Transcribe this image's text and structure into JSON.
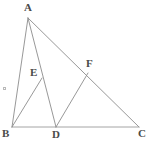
{
  "figure": {
    "width": 149,
    "height": 142,
    "background_color": "#ffffff",
    "stroke_color": "#8c8c8c",
    "base_stroke_color": "#9a9a9a",
    "label_color": "#4a4a4a",
    "stroke_width": 0.9
  },
  "points": {
    "A": {
      "label": "A",
      "x": 28,
      "y": 18,
      "label_x": 24,
      "label_y": 2
    },
    "B": {
      "label": "B",
      "x": 12,
      "y": 127,
      "label_x": 2,
      "label_y": 128
    },
    "C": {
      "label": "C",
      "x": 139,
      "y": 127,
      "label_x": 138,
      "label_y": 128
    },
    "D": {
      "label": "D",
      "x": 56,
      "y": 127,
      "label_x": 52,
      "label_y": 129
    },
    "E": {
      "label": "E",
      "x": 42,
      "y": 78,
      "label_x": 30,
      "label_y": 67
    },
    "F": {
      "label": "F",
      "x": 88,
      "y": 73,
      "label_x": 86,
      "label_y": 58
    }
  },
  "segments": [
    {
      "name": "segment-AB",
      "from": "A",
      "to": "B"
    },
    {
      "name": "segment-AC",
      "from": "A",
      "to": "C"
    },
    {
      "name": "segment-BC",
      "from": "B",
      "to": "C"
    },
    {
      "name": "segment-AD",
      "from": "A",
      "to": "D"
    },
    {
      "name": "segment-BE",
      "from": "B",
      "to": "E"
    },
    {
      "name": "segment-DF",
      "from": "D",
      "to": "F"
    }
  ],
  "marks": [
    {
      "name": "stray-mark",
      "x": 3,
      "y": 87
    }
  ]
}
